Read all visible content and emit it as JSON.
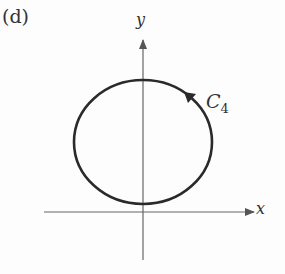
{
  "figure": {
    "panel_label": "(d)",
    "x_axis_label": "x",
    "y_axis_label": "y",
    "curve_label": "C",
    "curve_subscript": "4",
    "curve_shape": "closed circle above x-axis, tangent near origin",
    "orientation": "counterclockwise (arrow at upper right pointing up-left)",
    "colors": {
      "curve": "#2a2a2a",
      "axes": "#555555"
    }
  }
}
